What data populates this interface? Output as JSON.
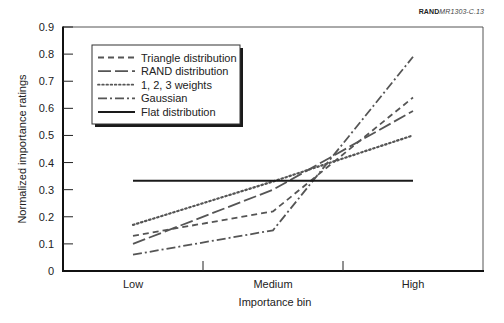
{
  "figure_id": {
    "brand": "RAND",
    "code": "MR1303-C.13"
  },
  "chart_data": {
    "type": "line",
    "title": "",
    "xlabel": "Importance bin",
    "ylabel": "Normalized importance ratings",
    "categories": [
      "Low",
      "Medium",
      "High"
    ],
    "ylim": [
      0,
      0.9
    ],
    "yticks": [
      "0",
      "0.1",
      "0.2",
      "0.3",
      "0.4",
      "0.5",
      "0.6",
      "0.7",
      "0.8",
      "0.9"
    ],
    "grid": false,
    "legend_position": "upper-left",
    "series": [
      {
        "name": "Triangle distribution",
        "style": "dashed",
        "values": [
          0.13,
          0.22,
          0.64
        ]
      },
      {
        "name": "RAND distribution",
        "style": "long-dashed",
        "values": [
          0.1,
          0.3,
          0.59
        ]
      },
      {
        "name": "1, 2, 3 weights",
        "style": "dotted",
        "values": [
          0.17,
          0.33,
          0.5
        ]
      },
      {
        "name": "Gaussian",
        "style": "dash-dot",
        "values": [
          0.06,
          0.15,
          0.79
        ]
      },
      {
        "name": "Flat distribution",
        "style": "solid",
        "values": [
          0.333,
          0.333,
          0.333
        ]
      }
    ]
  },
  "colors": {
    "line": "#555555",
    "flat_line": "#1a1a1a",
    "axis": "#111111"
  }
}
